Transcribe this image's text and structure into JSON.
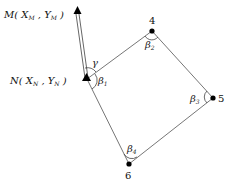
{
  "diagram": {
    "type": "traverse-survey",
    "points": {
      "M": {
        "label": "M( X",
        "sub_x": "M",
        "mid": " , Y",
        "sub_y": "M",
        "end": " )"
      },
      "N": {
        "label": "N( X",
        "sub_x": "N",
        "mid": " , Y",
        "sub_y": "N",
        "end": " )"
      },
      "p4": {
        "label": "4"
      },
      "p5": {
        "label": "5"
      },
      "p6": {
        "label": "6"
      }
    },
    "angles": {
      "gamma": "γ",
      "beta1": "β",
      "beta1_sub": "1",
      "beta2": "β",
      "beta2_sub": "2",
      "beta3": "β",
      "beta3_sub": "3",
      "beta4": "β",
      "beta4_sub": "4"
    },
    "colors": {
      "line": "#555555",
      "point": "#000000"
    }
  }
}
